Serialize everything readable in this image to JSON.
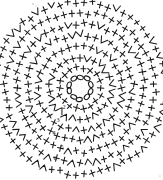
{
  "document": {
    "title": "Crochet Circle Pattern Chart",
    "type": "crochet-stitch-diagram",
    "background_color": "#ffffff",
    "ink_color": "#1a1a1a",
    "width_px": 163,
    "height_px": 180
  },
  "chart_data": {
    "type": "diagram",
    "subtitle": "",
    "xlabel": "",
    "ylabel": "",
    "grid": false,
    "legend_position": "none",
    "center": {
      "cx": 80,
      "cy": 88
    },
    "magic_ring": {
      "symbol_name": "chain-stitch-oval",
      "count": 10,
      "radius": 11,
      "oval_rx": 3.1,
      "oval_ry": 2.1
    },
    "round_labels": [
      {
        "text": "2",
        "x": 64,
        "y": 108
      },
      {
        "text": "3",
        "x": 58,
        "y": 121
      },
      {
        "text": "4",
        "x": 54,
        "y": 134
      },
      {
        "text": "5",
        "x": 62,
        "y": 148
      },
      {
        "text": "6",
        "x": 55,
        "y": 159
      }
    ],
    "rounds": [
      {
        "index": 1,
        "radius": 11,
        "stitch_count": 10,
        "symbol": "chain-oval",
        "label": ""
      },
      {
        "index": 2,
        "radius": 21,
        "stitch_count": 18,
        "symbol": "cross-plus",
        "label": "2"
      },
      {
        "index": 3,
        "radius": 31,
        "stitch_count": 26,
        "symbol": "mixed-plus-v",
        "label": "3"
      },
      {
        "index": 4,
        "radius": 42,
        "stitch_count": 34,
        "symbol": "mixed-plus-v",
        "label": "4"
      },
      {
        "index": 5,
        "radius": 53,
        "stitch_count": 42,
        "symbol": "mixed-plus-v",
        "label": "5"
      },
      {
        "index": 6,
        "radius": 64,
        "stitch_count": 50,
        "symbol": "mixed-plus-v",
        "label": "6"
      },
      {
        "index": 7,
        "radius": 75,
        "stitch_count": 58,
        "symbol": "mixed-plus-v",
        "label": ""
      },
      {
        "index": 8,
        "radius": 86,
        "stitch_count": 66,
        "symbol": "mixed-plus-v",
        "label": ""
      }
    ],
    "symbols": [
      {
        "name": "cross-plus",
        "meaning": "single crochet",
        "glyph": "+"
      },
      {
        "name": "vee",
        "meaning": "increase",
        "glyph": "V"
      },
      {
        "name": "chain-oval",
        "meaning": "chain stitch",
        "glyph": "O"
      }
    ]
  }
}
